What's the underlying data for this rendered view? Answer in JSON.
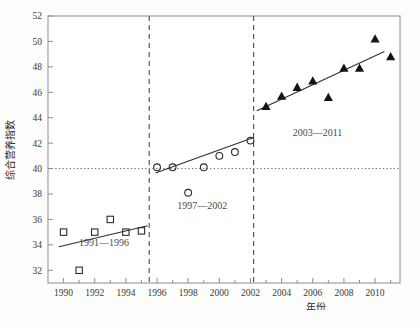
{
  "chart_data": {
    "type": "scatter",
    "title": "",
    "xlabel": "年份",
    "ylabel": "综合营养指数",
    "xlim": [
      1989.0,
      2011.6
    ],
    "ylim": [
      31.0,
      52.0
    ],
    "grid": false,
    "legend_position": "none",
    "xticks": [
      1990,
      1992,
      1994,
      1996,
      1998,
      2000,
      2002,
      2004,
      2006,
      2008,
      2010
    ],
    "xtick_labels": [
      "1990",
      "1992",
      "1994",
      "1996",
      "1998",
      "2000",
      "2002",
      "2004",
      "2006",
      "2008",
      "2010"
    ],
    "xminor_ticks": [
      1991,
      1993,
      1995,
      1997,
      1999,
      2001,
      2003,
      2005,
      2007,
      2009,
      2011
    ],
    "yticks": [
      32,
      34,
      36,
      38,
      40,
      42,
      44,
      46,
      48,
      50,
      52
    ],
    "ytick_labels": [
      "32",
      "34",
      "36",
      "38",
      "40",
      "42",
      "44",
      "46",
      "48",
      "50",
      "52"
    ],
    "series": [
      {
        "name": "1991—1996",
        "marker": "open-square",
        "x": [
          1990,
          1991,
          1992,
          1993,
          1994,
          1995
        ],
        "y": [
          35.0,
          32.0,
          35.0,
          36.0,
          35.0,
          35.1
        ]
      },
      {
        "name": "1997—2002",
        "marker": "open-circle",
        "x": [
          1996,
          1997,
          1998,
          1999,
          2000,
          2001,
          2002
        ],
        "y": [
          40.1,
          40.1,
          38.1,
          40.1,
          41.0,
          41.3,
          42.2
        ]
      },
      {
        "name": "2003—2011",
        "marker": "filled-triangle",
        "x": [
          2003,
          2004,
          2005,
          2006,
          2007,
          2008,
          2009,
          2010,
          2011
        ],
        "y": [
          44.9,
          45.7,
          46.4,
          46.9,
          45.6,
          47.9,
          47.9,
          50.2,
          48.8
        ]
      }
    ],
    "trend_lines": [
      {
        "name": "trend-1991-1996",
        "x": [
          1989.7,
          1995.4
        ],
        "y": [
          33.85,
          35.5
        ]
      },
      {
        "name": "trend-1997-2002",
        "x": [
          1995.9,
          2002.2
        ],
        "y": [
          39.65,
          42.45
        ]
      },
      {
        "name": "trend-2003-2011",
        "x": [
          2002.4,
          2010.6
        ],
        "y": [
          44.55,
          49.2
        ]
      }
    ],
    "reference_lines": [
      {
        "name": "hline-40",
        "orientation": "horizontal",
        "value": 40,
        "style": "dotted"
      },
      {
        "name": "vline-1995-5",
        "orientation": "vertical",
        "value": 1995.5,
        "style": "dashed"
      },
      {
        "name": "vline-2002-2",
        "orientation": "vertical",
        "value": 2002.2,
        "style": "dashed"
      }
    ],
    "annotations": [
      {
        "name": "annotation-1991-1996",
        "text": "1991—1996",
        "x": 1992.6,
        "y": 33.9
      },
      {
        "name": "annotation-1997-2002",
        "text": "1997—2002",
        "x": 1998.9,
        "y": 36.85
      },
      {
        "name": "annotation-2003-2011",
        "text": "2003—2011",
        "x": 2006.3,
        "y": 42.6
      }
    ]
  },
  "figure": {
    "caption": ""
  }
}
